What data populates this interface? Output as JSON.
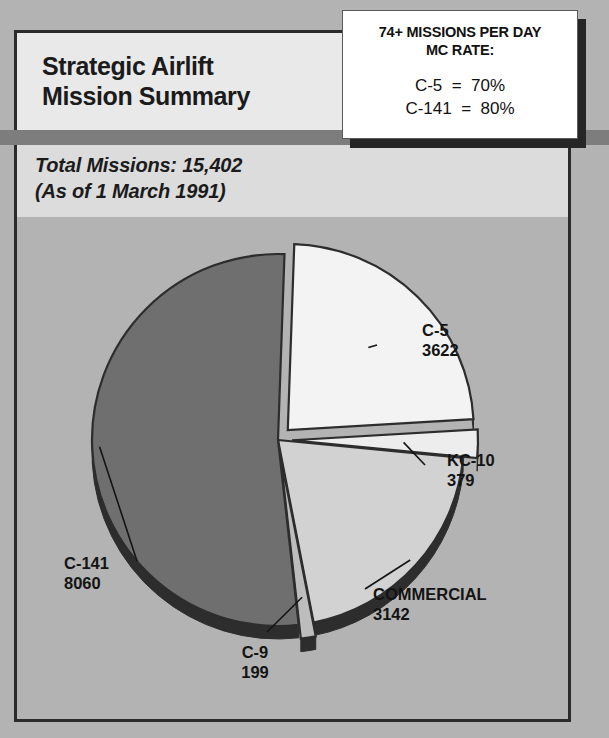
{
  "poster": {
    "title_line1": "Strategic Airlift",
    "title_line2": "Mission Summary",
    "subtitle_line1": "Total Missions:  15,402",
    "subtitle_line2": "(As of 1 March 1991)"
  },
  "callout": {
    "header_line1": "74+ MISSIONS PER DAY",
    "header_line2": "MC RATE:",
    "rate_row1": "C-5  =  70%",
    "rate_row2": "C-141  =  80%"
  },
  "chart_data": {
    "type": "pie",
    "title": "Strategic Airlift Mission Summary",
    "subtitle": "Total Missions: 15,402 (As of 1 March 1991)",
    "total": 15402,
    "legend_position": "callouts",
    "categories": [
      "C-5",
      "KC-10",
      "COMMERCIAL",
      "C-9",
      "C-141"
    ],
    "values": [
      3622,
      379,
      3142,
      199,
      8060
    ],
    "labels": [
      {
        "name": "C-5",
        "value": "3622",
        "percent": 23.5,
        "color": "#f3f3f3",
        "exploded": true
      },
      {
        "name": "KC-10",
        "value": "379",
        "percent": 2.5,
        "color": "#ededed",
        "exploded": true
      },
      {
        "name": "COMMERCIAL",
        "value": "3142",
        "percent": 20.4,
        "color": "#d2d2d2",
        "exploded": false
      },
      {
        "name": "C-9",
        "value": "199",
        "percent": 1.3,
        "color": "#bdbdbd",
        "exploded": true
      },
      {
        "name": "C-141",
        "value": "8060",
        "percent": 52.3,
        "color": "#6f6f6f",
        "exploded": false
      }
    ]
  },
  "colors": {
    "background": "#b3b3b3",
    "band": "#7d7d7d",
    "frame_border": "#2b2b2b",
    "header_panel": "#e9e9e9",
    "text": "#141414",
    "callout_bg": "#ffffff",
    "callout_shadow": "#262626"
  }
}
